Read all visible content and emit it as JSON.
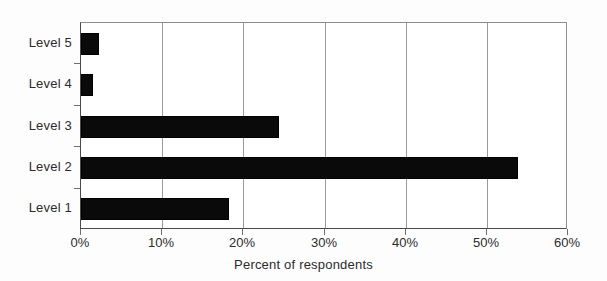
{
  "chart_data": {
    "type": "bar",
    "orientation": "horizontal",
    "title": "",
    "xlabel": "Percent of respondents",
    "ylabel": "",
    "categories": [
      "Level 1",
      "Level 2",
      "Level 3",
      "Level 4",
      "Level 5"
    ],
    "values": [
      18.2,
      53.9,
      24.4,
      1.5,
      2.2
    ],
    "xlim": [
      0,
      60
    ],
    "xticks": [
      0,
      10,
      20,
      30,
      40,
      50,
      60
    ],
    "xtick_labels": [
      "0%",
      "10%",
      "20%",
      "30%",
      "40%",
      "50%",
      "60%"
    ],
    "grid": "vertical",
    "legend": "none",
    "bar_color": "#0a0a0a",
    "plot_background": "#ffffff",
    "axis_color": "#4a4a4a",
    "gridline_color": "#9a9a9a",
    "display_order_top_to_bottom": [
      "Level 5",
      "Level 4",
      "Level 3",
      "Level 2",
      "Level 1"
    ],
    "series": [
      {
        "name": "Percent of respondents",
        "points": [
          {
            "category": "Level 5",
            "value": 2.2
          },
          {
            "category": "Level 4",
            "value": 1.5
          },
          {
            "category": "Level 3",
            "value": 24.4
          },
          {
            "category": "Level 2",
            "value": 53.9
          },
          {
            "category": "Level 1",
            "value": 18.2
          }
        ]
      }
    ]
  }
}
